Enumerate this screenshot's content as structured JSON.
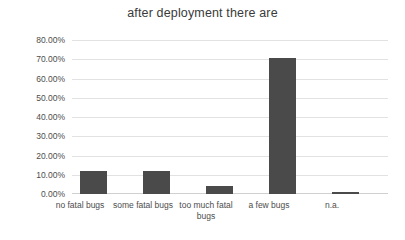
{
  "chart_data": {
    "type": "bar",
    "title": "after deployment there are",
    "xlabel": "",
    "ylabel": "",
    "categories": [
      "no fatal bugs",
      "some fatal bugs",
      "too much fatal bugs",
      "a few bugs",
      "n.a."
    ],
    "values": [
      12.0,
      12.0,
      4.0,
      70.5,
      1.0
    ],
    "value_labels": [
      "12.00%",
      "12.00%",
      "4.00%",
      "70.50%",
      "1.00%"
    ],
    "ylim": [
      0,
      80
    ],
    "ytick_values": [
      0,
      10,
      20,
      30,
      40,
      50,
      60,
      70,
      80
    ],
    "ytick_labels": [
      "0.00%",
      "10.00%",
      "20.00%",
      "30.00%",
      "40.00%",
      "50.00%",
      "60.00%",
      "70.00%",
      "80.00%"
    ],
    "grid": true,
    "grid_axis": "y",
    "legend": false,
    "legend_position": "none",
    "series": [
      {
        "name": "after deployment there are",
        "values": [
          12.0,
          12.0,
          4.0,
          70.5,
          1.0
        ],
        "color": "#4a4a4a"
      }
    ]
  },
  "colors": {
    "bar": "#4a4a4a",
    "gridline": "#e2e2e2",
    "baseline": "#d0d0d0",
    "title_text": "#3a3a3a",
    "tick_text": "#4d4d4d",
    "background": "#ffffff"
  }
}
